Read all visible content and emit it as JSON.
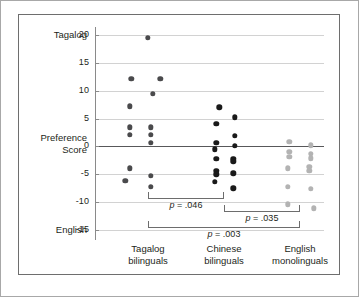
{
  "figure": {
    "y_axis_title_line1": "Preference",
    "y_axis_title_line2": "Score",
    "top_pole_label": "Tagalog",
    "bottom_pole_label": "English",
    "y_ticks": [
      "20",
      "15",
      "10",
      "5",
      "0",
      "-5",
      "-10",
      "-15"
    ],
    "groups": [
      {
        "line1": "Tagalog",
        "line2": "bilinguals"
      },
      {
        "line1": "Chinese",
        "line2": "bilinguals"
      },
      {
        "line1": "English",
        "line2": "monolinguals"
      }
    ],
    "annotations": [
      {
        "text": "p = .046"
      },
      {
        "text": "p = .035"
      },
      {
        "text": "p = .003"
      }
    ],
    "colors": {
      "dark_dot": "#4a4a4c",
      "black_dot": "#1a1a1a",
      "light_dot": "#b3b3b3",
      "zero_line": "#58585a",
      "gridline": "#d2d2d2",
      "panel_border": "#6e6e6e"
    }
  },
  "chart_data": {
    "type": "scatter",
    "title": "",
    "xlabel": "",
    "ylabel": "Preference Score",
    "ylim": [
      -15,
      20
    ],
    "yticks": [
      20,
      15,
      10,
      5,
      0,
      -5,
      -10,
      -15
    ],
    "grid": true,
    "legend": "none",
    "y_axis_pole_high": "Tagalog",
    "y_axis_pole_low": "English",
    "categories": [
      "Tagalog bilinguals",
      "Chinese bilinguals",
      "English monolinguals"
    ],
    "series": [
      {
        "name": "Tagalog bilinguals",
        "color": "#4a4a4c",
        "points": [
          {
            "jitter": 0.0,
            "value": 19.5
          },
          {
            "jitter": -0.22,
            "value": 12.1
          },
          {
            "jitter": 0.16,
            "value": 12.1
          },
          {
            "jitter": 0.06,
            "value": 9.5
          },
          {
            "jitter": -0.24,
            "value": 7.2
          },
          {
            "jitter": -0.24,
            "value": 3.4
          },
          {
            "jitter": 0.04,
            "value": 3.4
          },
          {
            "jitter": -0.24,
            "value": 2.1
          },
          {
            "jitter": 0.04,
            "value": 2.1
          },
          {
            "jitter": 0.04,
            "value": 0.6
          },
          {
            "jitter": -0.24,
            "value": -3.9
          },
          {
            "jitter": 0.04,
            "value": -5.3
          },
          {
            "jitter": -0.3,
            "value": -6.2
          },
          {
            "jitter": 0.04,
            "value": -7.2
          }
        ]
      },
      {
        "name": "Chinese bilinguals",
        "color": "#1a1a1a",
        "points": [
          {
            "jitter": -0.06,
            "value": 7.0
          },
          {
            "jitter": 0.14,
            "value": 5.2
          },
          {
            "jitter": -0.1,
            "value": 4.1
          },
          {
            "jitter": 0.14,
            "value": 1.9
          },
          {
            "jitter": -0.1,
            "value": 0.7
          },
          {
            "jitter": 0.14,
            "value": 0.1
          },
          {
            "jitter": -0.12,
            "value": -0.5
          },
          {
            "jitter": -0.1,
            "value": -2.2
          },
          {
            "jitter": 0.12,
            "value": -2.2
          },
          {
            "jitter": 0.12,
            "value": -2.7
          },
          {
            "jitter": -0.1,
            "value": -4.4
          },
          {
            "jitter": 0.12,
            "value": -4.8
          },
          {
            "jitter": -0.1,
            "value": -5.0
          },
          {
            "jitter": -0.12,
            "value": -6.4
          },
          {
            "jitter": 0.12,
            "value": -7.5
          }
        ]
      },
      {
        "name": "English monolinguals",
        "color": "#b3b3b3",
        "points": [
          {
            "jitter": -0.14,
            "value": 0.8
          },
          {
            "jitter": 0.14,
            "value": 0.2
          },
          {
            "jitter": -0.14,
            "value": -1.0
          },
          {
            "jitter": 0.14,
            "value": -1.3
          },
          {
            "jitter": -0.14,
            "value": -1.9
          },
          {
            "jitter": 0.14,
            "value": -2.1
          },
          {
            "jitter": -0.16,
            "value": -3.9
          },
          {
            "jitter": 0.12,
            "value": -3.7
          },
          {
            "jitter": 0.12,
            "value": -4.4
          },
          {
            "jitter": -0.16,
            "value": -7.3
          },
          {
            "jitter": 0.14,
            "value": -7.6
          },
          {
            "jitter": -0.16,
            "value": -10.4
          },
          {
            "jitter": 0.18,
            "value": -11.1
          }
        ]
      }
    ],
    "significance_brackets": [
      {
        "from": "Tagalog bilinguals",
        "to": "Chinese bilinguals",
        "label": "p = .046",
        "y": -9.4
      },
      {
        "from": "Chinese bilinguals",
        "to": "English monolinguals",
        "label": "p = .035",
        "y": -11.8
      },
      {
        "from": "Tagalog bilinguals",
        "to": "English monolinguals",
        "label": "p = .003",
        "y": -14.6
      }
    ]
  }
}
